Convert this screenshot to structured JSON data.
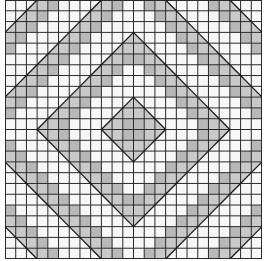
{
  "diagram": {
    "type": "quilt-pattern-grid",
    "grid": {
      "columns": 24,
      "rows": 24
    },
    "symmetry": "four-fold around center",
    "colors": {
      "background": "#ffffff",
      "fabric_light": "#f7f7f7",
      "fabric_shaded": "#c9c9c9",
      "fabric_shaded_dark": "#b8b8b8",
      "grid_line": "#2a2a2a",
      "diagonal_line": "#1a1a1a"
    },
    "bands": {
      "rule": "manhattan distance from center",
      "period": 6,
      "shaded_offsets": [
        0,
        1
      ],
      "triangle_offset": 2
    }
  }
}
